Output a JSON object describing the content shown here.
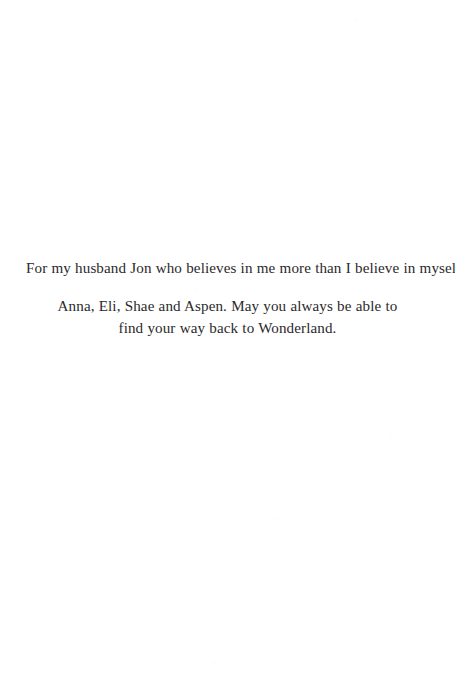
{
  "page": {
    "kind": "book-dedication-page",
    "background_color": "#ffffff",
    "ink_color": "#2b2a2a",
    "width": 455,
    "height": 691
  },
  "dedication": {
    "primary": "For my husband Jon who believes in me more than I believe in myself.",
    "secondary": "Anna, Eli, Shae and Aspen. May you always be able to find your way back to Wonderland."
  }
}
